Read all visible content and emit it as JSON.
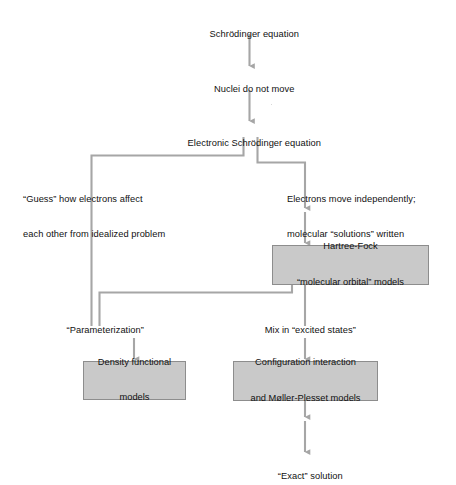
{
  "diagram": {
    "accent_fill": "#c9c9c9",
    "accent_border": "#8d8d8d",
    "line_color": "#a6a6a6",
    "text_color": "#111111",
    "nodes": {
      "schrodinger_equation": "Schrödinger equation",
      "nuclei_do_not_move": "Nuclei do not move",
      "electronic_schrodinger_equation": "Electronic Schrödinger equation",
      "guess_branch_line1": "“Guess” how electrons affect",
      "guess_branch_line2": "each other from idealized problem",
      "independent_branch_line1": "Electrons move independently;",
      "independent_branch_line2": "molecular “solutions” written",
      "independent_branch_line3": "in terms of atomic solutions",
      "hartree_fock_line1": "Hartree-Fock",
      "hartree_fock_line2": "“molecular orbital” models",
      "parameterization": "“Parameterization”",
      "mix_in_excited_states": "Mix in “excited states”",
      "density_functional_line1": "Density functional",
      "density_functional_line2": "models",
      "configuration_interaction_line1": "Configuration interaction",
      "configuration_interaction_line2": "and Møller-Plesset models",
      "exact_solution": "“Exact” solution"
    },
    "flow": {
      "type": "flowchart",
      "direction": "top-to-bottom",
      "steps": [
        {
          "from": "schrodinger_equation",
          "to": "nuclei_do_not_move",
          "style": "arrow"
        },
        {
          "from": "nuclei_do_not_move",
          "to": "electronic_schrodinger_equation",
          "style": "arrow"
        },
        {
          "from": "electronic_schrodinger_equation",
          "to": "guess_branch_line1",
          "style": "elbow-left"
        },
        {
          "from": "electronic_schrodinger_equation",
          "to": "independent_branch_line1",
          "style": "elbow-right"
        },
        {
          "from": "independent_branch_line3",
          "to": "hartree_fock_line1",
          "style": "arrow"
        },
        {
          "from": "hartree_fock_line2",
          "to": "parameterization",
          "style": "elbow-left"
        },
        {
          "from": "hartree_fock_line2",
          "to": "mix_in_excited_states",
          "style": "line"
        },
        {
          "from": "parameterization",
          "to": "density_functional_line1",
          "style": "arrow"
        },
        {
          "from": "mix_in_excited_states",
          "to": "configuration_interaction_line1",
          "style": "arrow"
        },
        {
          "from": "configuration_interaction_line2",
          "to": "exact_solution",
          "style": "arrow"
        }
      ]
    }
  }
}
